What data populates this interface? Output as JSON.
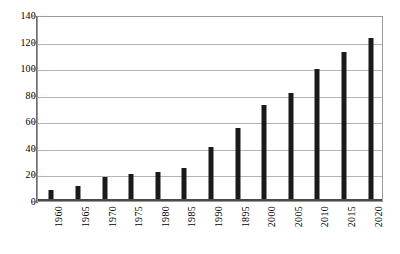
{
  "chart_data": {
    "type": "bar",
    "title": "",
    "subtitle": "",
    "xlabel": "",
    "ylabel": "",
    "categories": [
      "1960",
      "1965",
      "1970",
      "1975",
      "1980",
      "1985",
      "1990",
      "1895",
      "2000",
      "2005",
      "2010",
      "2015",
      "2020"
    ],
    "values": [
      8,
      11,
      18,
      20,
      22,
      25,
      41,
      55,
      72,
      81,
      99,
      112,
      123
    ],
    "series": [
      {
        "name": "",
        "values": [
          8,
          11,
          18,
          20,
          22,
          25,
          41,
          55,
          72,
          81,
          99,
          112,
          123
        ]
      }
    ],
    "ylim": [
      0,
      140
    ],
    "ytick_values": [
      0,
      20,
      40,
      60,
      80,
      100,
      120,
      140
    ],
    "ytick_labels": [
      "0",
      "20",
      "40",
      "60",
      "80",
      "100",
      "120",
      "140"
    ],
    "grid": "horizontal",
    "legend": "none",
    "bar_color": "#1a1a1a",
    "grid_color": "#b4b4b4",
    "frame_color": "#9a9a9a",
    "axis_color": "#6e6e6e",
    "background_color": "#ffffff",
    "xtick_rotation": -90,
    "annotations": []
  }
}
